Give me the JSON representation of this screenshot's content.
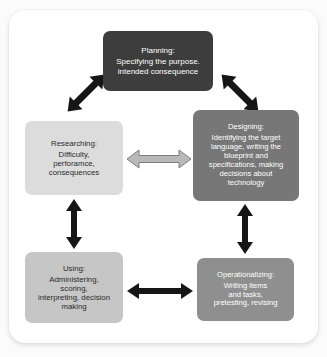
{
  "diagram": {
    "background_color": "#fbfbfb",
    "card_color": "#ffffff",
    "nodes": [
      {
        "id": "planning",
        "title": "Planning:",
        "body": "Specifying the purpose. intended consequence",
        "lines": [
          "Planning:",
          "Specifying the purpose.",
          "intended consequence"
        ],
        "fill": "#3d3d3d",
        "text_color": "#ffffff"
      },
      {
        "id": "designing",
        "title": "Designing:",
        "body": "Identifying the target language, writing the blueprint and specifications, making decisions about technology",
        "lines": [
          "Designing:",
          "Identifying the target",
          "language, writing the",
          "blueprint and",
          "specifications, making",
          "decisions about",
          "technology"
        ],
        "fill": "#777777",
        "text_color": "#ffffff"
      },
      {
        "id": "researching",
        "title": "Researching:",
        "body": "Difficulty, perforamce, consequences",
        "lines": [
          "Researching:",
          "Difficulty,",
          "perforamce,",
          "consequences"
        ],
        "fill": "#dcdcdc",
        "text_color": "#2b2b2b"
      },
      {
        "id": "using",
        "title": "Using:",
        "body": "Administering, scoring, interpreting, decision making",
        "lines": [
          "Using:",
          "Administering,",
          "scoring,",
          "interpreting, decision",
          "making"
        ],
        "fill": "#c6c6c6",
        "text_color": "#2b2b2b"
      },
      {
        "id": "operationalizing",
        "title": "Operationalizing:",
        "body": "Writing items and tasks, pretesting, revising",
        "lines": [
          "Operationalizing:",
          "Writing items",
          "and tasks,",
          "pretesting, revising"
        ],
        "fill": "#8f8f8f",
        "text_color": "#ffffff"
      }
    ],
    "connectors": [
      {
        "id": "researching-planning",
        "from": "researching",
        "to": "planning",
        "direction": "bidirectional",
        "orientation": "diagonal-up-right",
        "color": "#161616"
      },
      {
        "id": "planning-designing",
        "from": "planning",
        "to": "designing",
        "direction": "bidirectional",
        "orientation": "diagonal-down-right",
        "color": "#161616"
      },
      {
        "id": "researching-designing",
        "from": "researching",
        "to": "designing",
        "direction": "bidirectional",
        "orientation": "horizontal",
        "color": "#a8a8a8"
      },
      {
        "id": "researching-using",
        "from": "researching",
        "to": "using",
        "direction": "bidirectional",
        "orientation": "vertical",
        "color": "#161616"
      },
      {
        "id": "designing-operationalizing",
        "from": "designing",
        "to": "operationalizing",
        "direction": "bidirectional",
        "orientation": "vertical",
        "color": "#161616"
      },
      {
        "id": "using-operationalizing",
        "from": "using",
        "to": "operationalizing",
        "direction": "bidirectional",
        "orientation": "horizontal",
        "color": "#161616"
      }
    ]
  }
}
